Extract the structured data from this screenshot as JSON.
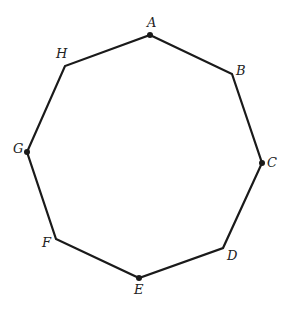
{
  "diagram": {
    "type": "regular-octagon",
    "stroke_color": "#1a1a1a",
    "vertices": [
      {
        "label": "A",
        "x": 150,
        "y": 35,
        "dot": true,
        "lx": 147,
        "ly": 27
      },
      {
        "label": "B",
        "x": 232,
        "y": 74,
        "dot": false,
        "lx": 236,
        "ly": 75
      },
      {
        "label": "C",
        "x": 262,
        "y": 163,
        "dot": true,
        "lx": 267,
        "ly": 167
      },
      {
        "label": "D",
        "x": 223,
        "y": 248,
        "dot": false,
        "lx": 227,
        "ly": 260
      },
      {
        "label": "E",
        "x": 139,
        "y": 278,
        "dot": true,
        "lx": 134,
        "ly": 294
      },
      {
        "label": "F",
        "x": 56,
        "y": 239,
        "dot": false,
        "lx": 42,
        "ly": 247
      },
      {
        "label": "G",
        "x": 27,
        "y": 152,
        "dot": true,
        "lx": 13,
        "ly": 153
      },
      {
        "label": "H",
        "x": 65,
        "y": 66,
        "dot": false,
        "lx": 56,
        "ly": 58
      }
    ]
  }
}
